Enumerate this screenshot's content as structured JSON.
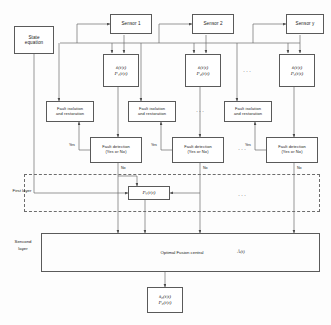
{
  "diagram": {
    "stroke_color": "#5a5a5a",
    "dashed_color": "#6d6d6d",
    "background": "#fdfdfd"
  },
  "state_equation": {
    "label": "State\nequation",
    "line1": "State",
    "line2": "equation"
  },
  "sensors": [
    {
      "id": "sensor-1",
      "label": "Sensor 1"
    },
    {
      "id": "sensor-2",
      "label": "Sensor 2"
    },
    {
      "id": "sensor-y",
      "label": "Sensor y"
    }
  ],
  "estimates": [
    {
      "id": "estimate-1",
      "state": "x̂(t|t)",
      "cov": "P₁(t|t)",
      "state_sym": "x̂",
      "state_arg": "(t|t)",
      "cov_sym": "P",
      "cov_sub": "1",
      "cov_arg": "(t|t)"
    },
    {
      "id": "estimate-2",
      "state": "x̂(t|t)",
      "cov": "P₂(t|t)",
      "state_sym": "x̂",
      "state_arg": "(t|t)",
      "cov_sym": "P",
      "cov_sub": "2",
      "cov_arg": "(t|t)"
    },
    {
      "id": "estimate-y",
      "state": "x̂(t|t)",
      "cov": "Pᵧ(t|t)",
      "state_sym": "x̂",
      "state_arg": "(t|t)",
      "cov_sym": "P",
      "cov_sub": "y",
      "cov_arg": "(t|t)"
    }
  ],
  "fault_isolation": [
    {
      "id": "fault-isolation-1",
      "line1": "Fault isolation",
      "line2": "and restoration"
    },
    {
      "id": "fault-isolation-2",
      "line1": "Fault isolation",
      "line2": "and restoration"
    },
    {
      "id": "fault-isolation-y",
      "line1": "Fault isolation",
      "line2": "and restoration"
    }
  ],
  "fault_detection": [
    {
      "id": "fault-detection-1",
      "line1": "Fault detection",
      "line2": "(Yes or No)",
      "yes_label": "Yes",
      "no_label": "No"
    },
    {
      "id": "fault-detection-2",
      "line1": "Fault detection",
      "line2": "(Yes or No)",
      "yes_label": "Yes",
      "no_label": "No"
    },
    {
      "id": "fault-detection-y",
      "line1": "Fault detection",
      "line2": "(Yes or No)",
      "yes_label": "Yes",
      "no_label": "No"
    }
  ],
  "cross_covariance": {
    "id": "cross-covariance",
    "text": "Pᵢⱼ(t|t)",
    "sym": "P",
    "sub": "ij",
    "arg": "(t|t)"
  },
  "layers": {
    "first": {
      "name_line1": "First layer",
      "name_line2": ""
    },
    "second": {
      "name_line1": "Sencond",
      "name_line2": "layer"
    }
  },
  "fusion_center": {
    "id": "optimal-fusion-central",
    "label": "Optimal Fusion central",
    "variable": "Âᵢ(t)",
    "var_sym": "Â",
    "var_sub": "i",
    "var_arg": "(t)"
  },
  "fusion_output": {
    "id": "fusion-output",
    "state": "x̂₀(t|t)",
    "cov": "P₀(t|t)",
    "state_sym": "x̂",
    "state_sub": "0",
    "state_arg": "(t|t)",
    "cov_sym": "P",
    "cov_sub": "0",
    "cov_arg": "(t|t)"
  },
  "ellipses": [
    {
      "id": "ellipsis-estimates",
      "text": "···"
    },
    {
      "id": "ellipsis-isolation",
      "text": "···"
    },
    {
      "id": "ellipsis-detection",
      "text": "···"
    },
    {
      "id": "ellipsis-first-layer",
      "text": "···"
    }
  ]
}
